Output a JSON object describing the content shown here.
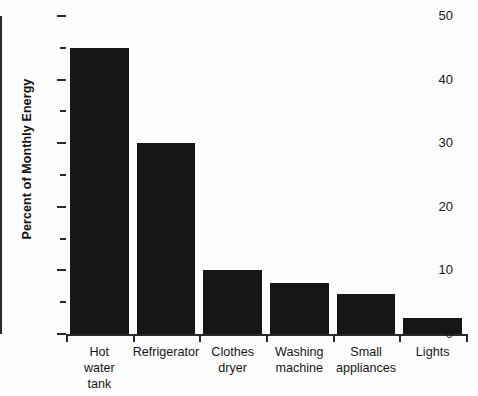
{
  "chart_data": {
    "type": "bar",
    "title": "",
    "xlabel": "",
    "ylabel": "Percent of Monthly Energy",
    "ylim": [
      0,
      50
    ],
    "y_major_ticks": [
      0,
      10,
      20,
      30,
      40,
      50
    ],
    "y_minor_ticks": [
      5,
      15,
      25,
      35,
      45
    ],
    "y_tick_labels": [
      "0",
      "10",
      "20",
      "30",
      "40",
      "50"
    ],
    "grid": false,
    "legend": null,
    "bar_color": "#161616",
    "axis_color": "#2a2a2a",
    "categories": [
      "Hot water tank",
      "Refrigerator",
      "Clothes dryer",
      "Washing machine",
      "Small appliances",
      "Lights"
    ],
    "category_lines": [
      [
        "Hot",
        "water",
        "tank"
      ],
      [
        "Refrigerator"
      ],
      [
        "Clothes",
        "dryer"
      ],
      [
        "Washing",
        "machine"
      ],
      [
        "Small",
        "appliances"
      ],
      [
        "Lights"
      ]
    ],
    "values": [
      45,
      30,
      10,
      8,
      6.3,
      2.5
    ]
  }
}
